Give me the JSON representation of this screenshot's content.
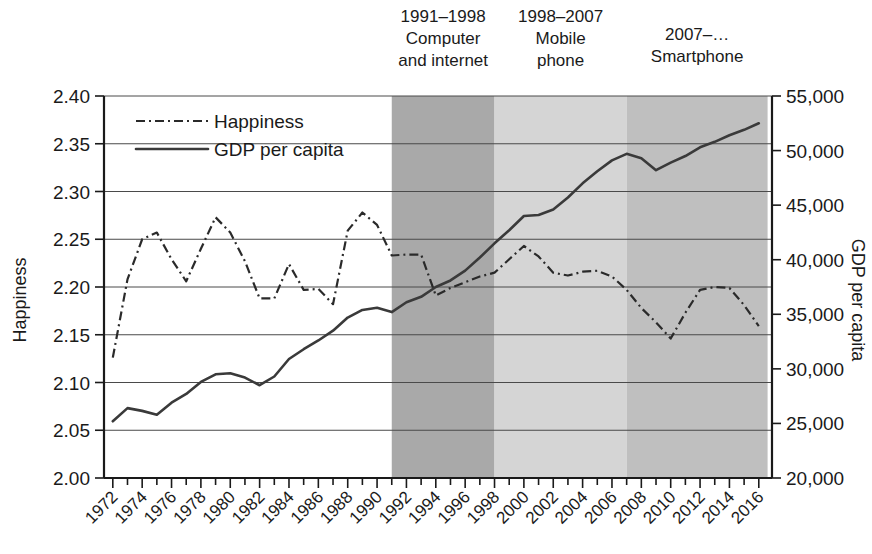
{
  "chart_data": {
    "type": "line",
    "title": "",
    "xlabel": "",
    "ylabel": "Happiness",
    "y2label": "GDP per capita",
    "x": [
      1972,
      1973,
      1974,
      1975,
      1976,
      1977,
      1978,
      1979,
      1980,
      1981,
      1982,
      1983,
      1984,
      1985,
      1986,
      1987,
      1988,
      1989,
      1990,
      1991,
      1992,
      1993,
      1994,
      1995,
      1996,
      1997,
      1998,
      1999,
      2000,
      2001,
      2002,
      2003,
      2004,
      2005,
      2006,
      2007,
      2008,
      2009,
      2010,
      2011,
      2012,
      2013,
      2014,
      2015,
      2016
    ],
    "xtick_labels": [
      "1972",
      "1974",
      "1976",
      "1978",
      "1980",
      "1982",
      "1984",
      "1986",
      "1988",
      "1990",
      "1992",
      "1994",
      "1996",
      "1998",
      "2000",
      "2002",
      "2004",
      "2006",
      "2008",
      "2010",
      "2012",
      "2014",
      "2016"
    ],
    "ylim": [
      2.0,
      2.4
    ],
    "ytick_labels": [
      "2.00",
      "2.05",
      "2.10",
      "2.15",
      "2.20",
      "2.25",
      "2.30",
      "2.35",
      "2.40"
    ],
    "y2lim": [
      20000,
      55000
    ],
    "y2tick_labels": [
      "20,000",
      "25,000",
      "30,000",
      "35,000",
      "40,000",
      "45,000",
      "50,000",
      "55,000"
    ],
    "grid": true,
    "legend_position": "top-left",
    "series": [
      {
        "name": "Happiness",
        "axis": "left",
        "style": "dash-dot",
        "values": [
          2.126,
          2.208,
          2.25,
          2.257,
          2.229,
          2.206,
          2.24,
          2.273,
          2.257,
          2.227,
          2.188,
          2.188,
          2.224,
          2.197,
          2.198,
          2.182,
          2.259,
          2.278,
          2.265,
          2.233,
          2.234,
          2.234,
          2.191,
          2.199,
          2.205,
          2.211,
          2.215,
          2.229,
          2.243,
          2.232,
          2.215,
          2.212,
          2.216,
          2.217,
          2.211,
          2.197,
          2.178,
          2.163,
          2.146,
          2.173,
          2.197,
          2.2,
          2.199,
          2.181,
          2.159
        ]
      },
      {
        "name": "GDP per capita",
        "axis": "right",
        "style": "solid",
        "values": [
          25200,
          26400,
          26150,
          25800,
          26900,
          27700,
          28800,
          29500,
          29600,
          29200,
          28500,
          29300,
          30900,
          31800,
          32600,
          33500,
          34700,
          35400,
          35600,
          35200,
          36100,
          36600,
          37500,
          38100,
          39000,
          40200,
          41500,
          42700,
          44000,
          44100,
          44600,
          45700,
          47000,
          48100,
          49100,
          49700,
          49300,
          48200,
          48900,
          49500,
          50300,
          50800,
          51400,
          51900,
          52500
        ]
      }
    ],
    "annotations": [
      {
        "period": "1991–1998",
        "line2": "Computer",
        "line3": "and internet",
        "start": 1991,
        "end": 1998,
        "shade": "#a9a9a9"
      },
      {
        "period": "1998–2007",
        "line2": "Mobile",
        "line3": "phone",
        "start": 1998,
        "end": 2007,
        "shade": "#d5d5d5"
      },
      {
        "period": "2007–…",
        "line2": "Smartphone",
        "line3": "",
        "start": 2007,
        "end": 2016.6,
        "shade": "#bfbfbf"
      }
    ]
  },
  "legend": {
    "items": [
      {
        "label": "Happiness",
        "style": "dash-dot"
      },
      {
        "label": "GDP per capita",
        "style": "solid"
      }
    ]
  }
}
